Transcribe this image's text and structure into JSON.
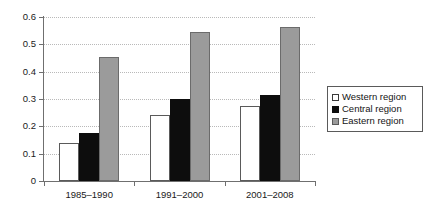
{
  "chart_data": {
    "type": "bar",
    "title": "",
    "subtitle": "",
    "xlabel": "",
    "ylabel": "",
    "ylim": [
      0,
      0.6
    ],
    "ytick_labels": [
      "0",
      "0.1",
      "0.2",
      "0.3",
      "0.4",
      "0.5",
      "0.6"
    ],
    "ytick_values": [
      0,
      0.1,
      0.2,
      0.3,
      0.4,
      0.5,
      0.6
    ],
    "grid": "horizontal-dotted",
    "legend_position": "right",
    "categories": [
      "1985–1990",
      "1991–2000",
      "2001–2008"
    ],
    "series": [
      {
        "name": "Western region",
        "color": "#ffffff",
        "values": [
          0.14,
          0.24,
          0.275
        ]
      },
      {
        "name": "Central region",
        "color": "#0d0d0d",
        "values": [
          0.175,
          0.3,
          0.315
        ]
      },
      {
        "name": "Eastern region",
        "color": "#9b9b9b",
        "values": [
          0.455,
          0.545,
          0.565
        ]
      }
    ]
  },
  "legend": {
    "items": [
      {
        "label": "Western region",
        "swatch": "western"
      },
      {
        "label": "Central region",
        "swatch": "central"
      },
      {
        "label": "Eastern region",
        "swatch": "eastern"
      }
    ]
  },
  "colors": {
    "axis": "#6f6f6f",
    "grid": "#b9b9b9",
    "text": "#1a1a1a",
    "western": "#ffffff",
    "central": "#0d0d0d",
    "eastern": "#9b9b9b"
  }
}
